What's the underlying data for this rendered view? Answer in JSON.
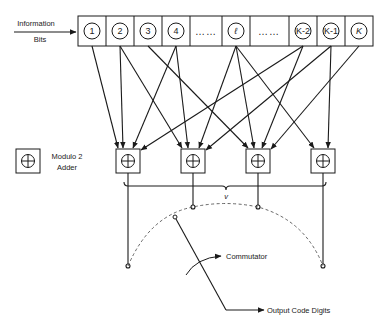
{
  "diagram": {
    "input_label": {
      "line1": "Information",
      "line2": "Bits"
    },
    "register_cells": [
      {
        "label": "1",
        "type": "stage"
      },
      {
        "label": "2",
        "type": "stage"
      },
      {
        "label": "3",
        "type": "stage"
      },
      {
        "label": "4",
        "type": "stage"
      },
      {
        "label": "……",
        "type": "ellipsis"
      },
      {
        "label": "ℓ",
        "type": "stage"
      },
      {
        "label": "……",
        "type": "ellipsis"
      },
      {
        "label": "K-2",
        "type": "stage"
      },
      {
        "label": "K-1",
        "type": "stage"
      },
      {
        "label": "K",
        "type": "stage"
      }
    ],
    "legend": {
      "symbol": "⊕",
      "line1": "Modulo 2",
      "line2": "Adder"
    },
    "adders": [
      {
        "id": "adder-1",
        "inputs": [
          "1",
          "2",
          "4",
          "K-2"
        ]
      },
      {
        "id": "adder-2",
        "inputs": [
          "2",
          "4",
          "ℓ",
          "K-1"
        ]
      },
      {
        "id": "adder-3",
        "inputs": [
          "3",
          "ℓ",
          "K-2",
          "K"
        ]
      },
      {
        "id": "adder-4",
        "inputs": [
          "ℓ",
          "K-1"
        ]
      }
    ],
    "brace_label": "v",
    "commutator_label": "Commutator",
    "output_label": "Output Code Digits",
    "colors": {
      "line": "#1a1a1a",
      "background": "#ffffff"
    }
  }
}
